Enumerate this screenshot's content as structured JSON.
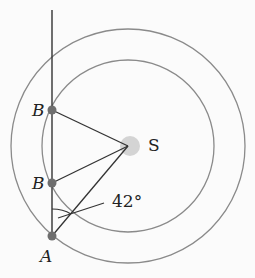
{
  "diagram": {
    "labels": {
      "b_upper": "B",
      "b_lower": "B",
      "a": "A",
      "s": "S",
      "angle": "42°"
    },
    "colors": {
      "line": "#333333",
      "circle": "#8a8a8a",
      "point": "#6e6e6e",
      "sun_glow": "#d4d4d4"
    }
  }
}
